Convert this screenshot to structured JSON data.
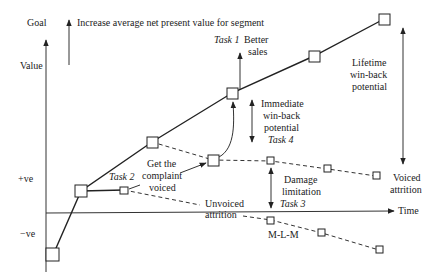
{
  "goal": {
    "label": "Goal",
    "text": "Increase average net present value for segment"
  },
  "axes": {
    "y_label": "Value",
    "x_label": "Time",
    "pos_label": "+ve",
    "neg_label": "−ve"
  },
  "tasks": {
    "task1": {
      "label": "Task 1",
      "text": "Better sales"
    },
    "task2": {
      "label": "Task 2"
    },
    "task3": {
      "label": "Task 3"
    },
    "task4": {
      "label": "Task 4"
    }
  },
  "annotations": {
    "get_complaint_voiced": [
      "Get the",
      "complaint",
      "voiced"
    ],
    "immediate_winback": [
      "Immediate",
      "win-back",
      "potential"
    ],
    "lifetime_winback": [
      "Lifetime",
      "win-back",
      "potential"
    ],
    "damage_limitation": [
      "Damage",
      "limitation"
    ],
    "voiced_attrition": [
      "Voiced",
      "attrition"
    ],
    "unvoiced_attrition": [
      "Unvoiced",
      "attrition"
    ],
    "mlm": "M-L-M"
  }
}
